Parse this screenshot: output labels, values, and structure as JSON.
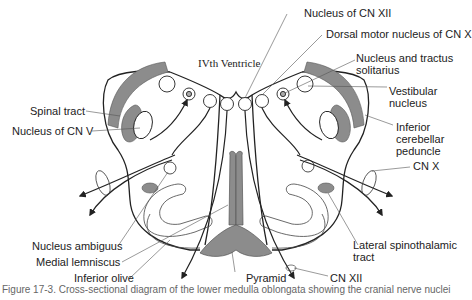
{
  "diagram": {
    "type": "anatomical cross-section",
    "labels": {
      "ventricle": "IVth Ventricle",
      "nucleus_cn_xii": "Nucleus of CN XII",
      "dorsal_motor_nucleus": "Dorsal motor nucleus of CN X",
      "nucleus_tractus_solitarius_1": "Nucleus and tractus",
      "nucleus_tractus_solitarius_2": "solitarius",
      "vestibular_nucleus_1": "Vestibular",
      "vestibular_nucleus_2": "nucleus",
      "inferior_cerebellar_peduncle_1": "Inferior",
      "inferior_cerebellar_peduncle_2": "cerebellar",
      "inferior_cerebellar_peduncle_3": "peduncle",
      "spinal_tract": "Spinal tract",
      "nucleus_cn_v": "Nucleus of CN V",
      "cn_x": "CN X",
      "nucleus_ambiguus": "Nucleus ambiguus",
      "medial_lemniscus": "Medial lemniscus",
      "inferior_olive": "Inferior olive",
      "pyramid": "Pyramid",
      "cn_xii": "CN XII",
      "lateral_spinothalamic_1": "Lateral spinothalamic",
      "lateral_spinothalamic_2": "tract"
    },
    "colors": {
      "outline": "#222222",
      "fill_gray": "#8c8c8c",
      "leader": "#444444",
      "text": "#222222"
    }
  },
  "caption": {
    "text": "Figure 17-3. Cross-sectional diagram of the lower medulla oblongata showing the cranial nerve nuclei"
  }
}
